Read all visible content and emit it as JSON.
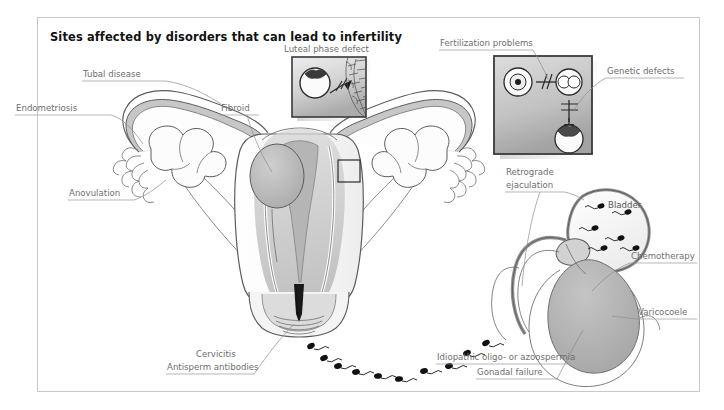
{
  "figure": {
    "title": "Sites affected by disorders that can lead to infertility",
    "frame_color": "#c9c9c9",
    "background": "#ffffff",
    "label_color": "#6e6e6e",
    "ink_color": "#5c5c5c"
  },
  "labels": {
    "tubal_disease": "Tubal disease",
    "endometriosis": "Endometriosis",
    "anovulation": "Anovulation",
    "fibroid": "Fibroid",
    "luteal_phase_defect": "Luteal phase defect",
    "fertilization_problems": "Fertilization problems",
    "genetic_defects": "Genetic defects",
    "retrograde_ejaculation_line1": "Retrograde",
    "retrograde_ejaculation_line2": "ejaculation",
    "bladder": "Bladder",
    "chemotherapy": "Chemotherapy",
    "varicocoele": "Varicocoele",
    "idiopathic": "Idiopathic oligo- or azoospermia",
    "gonadal_failure": "Gonadal failure",
    "cervicitis": "Cervicitis",
    "antisperm_antibodies": "Antisperm antibodies"
  },
  "insets": {
    "luteal": {
      "caption": "Luteal phase defect",
      "border_color": "#3a3a3a",
      "fill_top": "#e9e9e9",
      "fill_bottom": "#b4b4b4"
    },
    "fertilization": {
      "caption_left": "Fertilization problems",
      "caption_right": "Genetic defects",
      "border_color": "#3a3a3a",
      "fill_top": "#d8d8d8",
      "fill_bottom": "#a8a8a8"
    }
  },
  "anatomy": {
    "uterus_fill": "#f7f7f7",
    "myometrium_fill": "#c9c9c9",
    "cavity_fill": "#b9b9b9",
    "fibroid_fill": "#bcbcbc",
    "ovary_fill": "#fbfbfb",
    "bladder_fill": "#f4f4f4",
    "testis_fill": "#b6b6b6",
    "sperm_color": "#111111"
  }
}
